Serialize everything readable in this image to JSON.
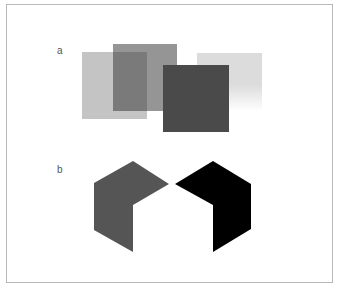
{
  "panels": [
    {
      "label": "a",
      "squares": [
        {
          "name": "light-square",
          "x": 82,
          "y": 52,
          "w": 65,
          "h": 67,
          "color": "#c4c4c4"
        },
        {
          "name": "mid-square",
          "x": 113,
          "y": 44,
          "w": 64,
          "h": 67,
          "color": "#8a8a8a"
        },
        {
          "name": "light-right-square",
          "x": 197,
          "y": 53,
          "w": 65,
          "h": 58,
          "color": "#dcdcdc"
        },
        {
          "name": "dark-square",
          "x": 163,
          "y": 65,
          "w": 66,
          "h": 67,
          "color": "#4a4a4a"
        }
      ]
    },
    {
      "label": "b",
      "shapes": [
        {
          "name": "gray-hex-shape",
          "points": "133,161 169,184 133,205 133,252 94,230 94,183",
          "color": "#555555"
        },
        {
          "name": "black-hex-shape",
          "points": "213,161 251,184 251,229 213,252 213,205 175,184",
          "color": "#000000"
        }
      ]
    }
  ]
}
